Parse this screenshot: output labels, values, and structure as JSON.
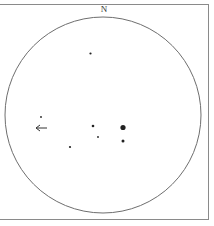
{
  "sketch": {
    "orientation_label": "N",
    "field_of_view": {
      "cx": 103,
      "cy": 115,
      "r": 98,
      "stroke": "#6e6e6e"
    },
    "stars": [
      {
        "x": 90.5,
        "y": 53.5,
        "r": 1.1
      },
      {
        "x": 41,
        "y": 117,
        "r": 0.9
      },
      {
        "x": 93,
        "y": 126,
        "r": 1.3
      },
      {
        "x": 123,
        "y": 127.5,
        "r": 2.6
      },
      {
        "x": 98,
        "y": 137,
        "r": 0.9
      },
      {
        "x": 123,
        "y": 141,
        "r": 1.5
      },
      {
        "x": 70,
        "y": 147,
        "r": 1.1
      }
    ],
    "motion_arrow": {
      "x1": 47,
      "y1": 128,
      "x2": 36,
      "y2": 128,
      "direction": "west"
    },
    "star_color": "#222222"
  }
}
